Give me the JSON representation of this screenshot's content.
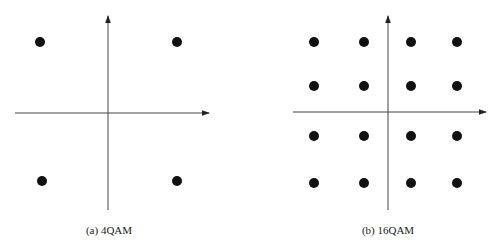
{
  "figure": {
    "panels": [
      {
        "id": "a",
        "caption": "(a) 4QAM",
        "constellation": "4QAM",
        "points_grid": "2x2"
      },
      {
        "id": "b",
        "caption": "(b) 16QAM",
        "constellation": "16QAM",
        "points_grid": "4x4"
      }
    ],
    "colors": {
      "background": "#ffffff",
      "axis": "#333333",
      "point": "#111111",
      "text": "#1a1a1a"
    }
  }
}
